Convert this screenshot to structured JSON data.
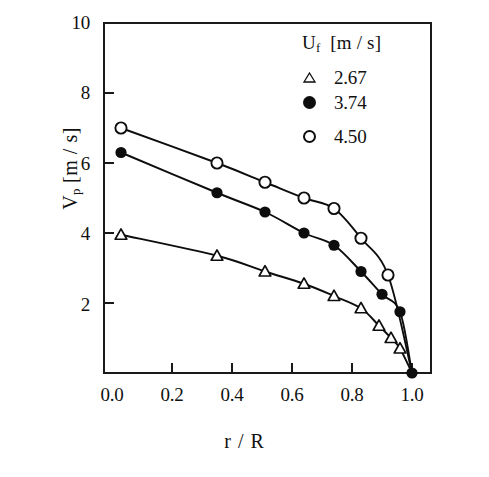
{
  "chart_data": {
    "type": "scatter",
    "title": "",
    "xlabel": "r / R",
    "ylabel": "V_p [m / s]",
    "ylabel_main": "V",
    "ylabel_sub": "p",
    "ylabel_units": "[m / s]",
    "xlim": [
      0.0,
      1.0
    ],
    "ylim": [
      0,
      10
    ],
    "grid": false,
    "legend_position": "top-right",
    "legend_title": "U_f  [m / s]",
    "legend_title_main": "U",
    "legend_title_sub": "f",
    "legend_title_units": "[m / s]",
    "xticks": [
      "0.0",
      "0.2",
      "0.4",
      "0.6",
      "0.8",
      "1.0"
    ],
    "xtick_values": [
      0.0,
      0.2,
      0.4,
      0.6,
      0.8,
      1.0
    ],
    "yticks": [
      "2",
      "4",
      "6",
      "8",
      "10"
    ],
    "ytick_values": [
      2,
      4,
      6,
      8,
      10
    ],
    "series": [
      {
        "name": "2.67",
        "label": "2.67",
        "marker": "open-triangle",
        "color": "#0d0d0d",
        "x": [
          0.03,
          0.35,
          0.51,
          0.64,
          0.74,
          0.83,
          0.89,
          0.93,
          0.96,
          1.0
        ],
        "y": [
          3.95,
          3.35,
          2.9,
          2.55,
          2.2,
          1.85,
          1.35,
          1.0,
          0.7,
          0.0
        ]
      },
      {
        "name": "3.74",
        "label": "3.74",
        "marker": "filled-circle",
        "color": "#0d0d0d",
        "x": [
          0.03,
          0.35,
          0.51,
          0.64,
          0.74,
          0.83,
          0.9,
          0.96,
          1.0
        ],
        "y": [
          6.3,
          5.15,
          4.6,
          4.0,
          3.65,
          2.9,
          2.25,
          1.75,
          0.0
        ]
      },
      {
        "name": "4.50",
        "label": "4.50",
        "marker": "open-circle",
        "color": "#0d0d0d",
        "x": [
          0.03,
          0.35,
          0.51,
          0.64,
          0.74,
          0.83,
          0.92,
          1.0
        ],
        "y": [
          7.0,
          6.0,
          5.45,
          5.0,
          4.7,
          3.85,
          2.8,
          0.0
        ]
      }
    ]
  }
}
